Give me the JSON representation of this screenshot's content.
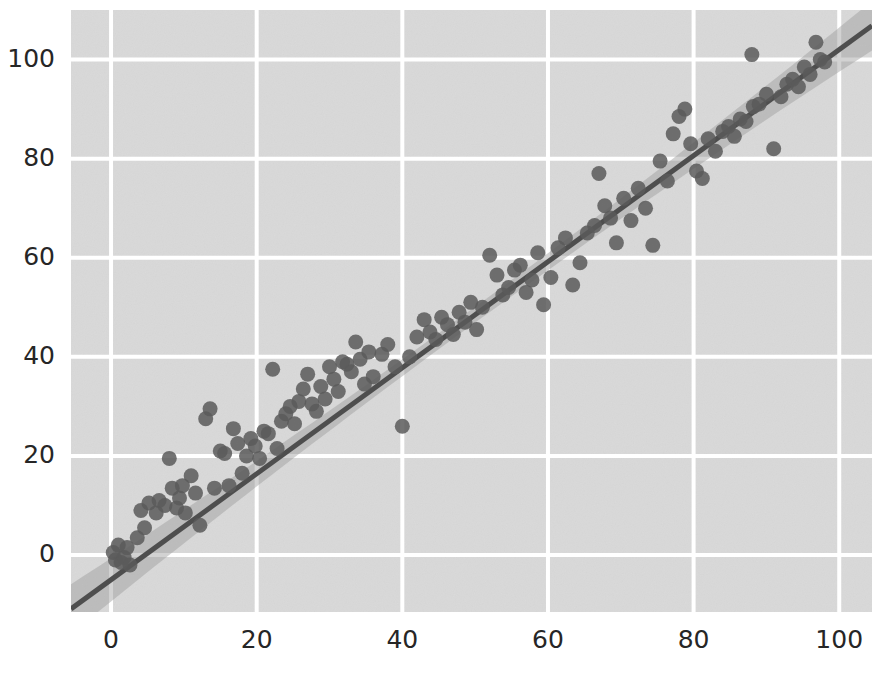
{
  "figure": {
    "width": 872,
    "height": 681,
    "background_color": "#ffffff",
    "style": "seaborn-darkgrid"
  },
  "colors": {
    "axes_background": "#d9d9d9",
    "grid": "#ffffff",
    "marker": "#5a5a5a",
    "regression_line": "#4e4e4e",
    "confidence_band": "#9c9c9c",
    "tick_label": "#262626"
  },
  "chart_data": {
    "type": "scatter",
    "title": "",
    "subtitle": "",
    "xlabel": "",
    "ylabel": "",
    "xlim": [
      -5.5,
      104.5
    ],
    "ylim": [
      -11.5,
      110.0
    ],
    "xticks": [
      0,
      20,
      40,
      60,
      80,
      100
    ],
    "yticks": [
      0,
      20,
      40,
      60,
      80,
      100
    ],
    "xticklabels": [
      "0",
      "20",
      "40",
      "60",
      "80",
      "100"
    ],
    "yticklabels": [
      "0",
      "20",
      "40",
      "60",
      "80",
      "100"
    ],
    "grid": true,
    "grid_axis": "both",
    "legend": null,
    "legend_position": "none",
    "marker": {
      "shape": "circle",
      "size_px": 15,
      "color": "#5a5a5a",
      "alpha": 0.85
    },
    "regression": {
      "shown": true,
      "kind": "linear",
      "slope": 1.07,
      "intercept": -5.0,
      "line_color": "#4e4e4e",
      "line_width_px": 5,
      "confidence_interval": 95,
      "band_color": "#9c9c9c",
      "x_start": -5.5,
      "x_end": 104.5,
      "y_start": -10.9,
      "y_end": 106.8
    },
    "series": [
      {
        "name": "observations",
        "n_points": 116,
        "x": [
          0.3,
          0.6,
          1.0,
          1.4,
          1.8,
          2.2,
          2.6,
          3.6,
          4.1,
          4.6,
          5.2,
          6.2,
          6.6,
          7.4,
          8.0,
          8.4,
          9.0,
          9.4,
          9.8,
          10.2,
          11.0,
          11.6,
          12.2,
          13.0,
          13.6,
          14.2,
          15.0,
          15.6,
          16.2,
          16.8,
          17.4,
          18.0,
          18.6,
          19.2,
          19.8,
          20.4,
          21.0,
          21.6,
          22.2,
          22.8,
          23.4,
          24.0,
          24.6,
          25.2,
          25.8,
          26.4,
          27.0,
          27.6,
          28.2,
          28.8,
          29.4,
          30.0,
          30.6,
          31.2,
          31.8,
          32.4,
          33.0,
          33.6,
          34.2,
          34.8,
          35.4,
          36.0,
          37.2,
          38.0,
          39.0,
          40.0,
          41.0,
          42.0,
          43.0,
          43.8,
          44.6,
          45.4,
          46.2,
          47.0,
          47.8,
          48.6,
          49.4,
          50.2,
          51.0,
          52.0,
          53.0,
          53.8,
          54.6,
          55.4,
          56.2,
          57.0,
          57.8,
          58.6,
          59.4,
          60.4,
          61.4,
          62.4,
          63.4,
          64.4,
          65.4,
          66.4,
          67.0,
          67.8,
          68.6,
          69.4,
          70.4,
          71.4,
          72.4,
          73.4,
          74.4,
          75.4,
          76.4,
          77.2,
          78.0,
          78.8,
          79.6,
          80.4,
          81.2,
          82.0,
          83.0,
          84.0
        ],
        "y": [
          0.5,
          -1.0,
          2.0,
          -1.5,
          -0.5,
          1.5,
          -2.0,
          3.5,
          9.0,
          5.5,
          10.5,
          8.5,
          11.0,
          10.0,
          19.5,
          13.5,
          9.5,
          11.5,
          14.0,
          8.5,
          16.0,
          12.5,
          6.0,
          27.5,
          29.5,
          13.5,
          21.0,
          20.5,
          14.0,
          25.5,
          22.5,
          16.5,
          20.0,
          23.5,
          22.0,
          19.5,
          25.0,
          24.5,
          37.5,
          21.5,
          27.0,
          28.5,
          30.0,
          26.5,
          31.0,
          33.5,
          36.5,
          30.5,
          29.0,
          34.0,
          31.5,
          38.0,
          35.5,
          33.0,
          39.0,
          38.5,
          37.0,
          43.0,
          39.5,
          34.5,
          41.0,
          36.0,
          40.5,
          42.5,
          38.0,
          26.0,
          40.0,
          44.0,
          47.5,
          45.0,
          43.5,
          48.0,
          46.5,
          44.5,
          49.0,
          47.0,
          51.0,
          45.5,
          50.0,
          60.5,
          56.5,
          52.5,
          54.0,
          57.5,
          58.5,
          53.0,
          55.5,
          61.0,
          50.5,
          56.0,
          62.0,
          64.0,
          54.5,
          59.0,
          65.0,
          66.5,
          77.0,
          70.5,
          68.0,
          63.0,
          72.0,
          67.5,
          74.0,
          70.0,
          62.5,
          79.5,
          75.5,
          85.0,
          88.5,
          90.0,
          83.0,
          77.5,
          76.0,
          84.0,
          81.5,
          85.5
        ]
      },
      {
        "name": "observations-upper",
        "n_points": 18,
        "x": [
          84.8,
          85.6,
          86.4,
          87.2,
          88.0,
          88.2,
          89.0,
          90.0,
          91.0,
          92.0,
          92.8,
          93.6,
          94.4,
          95.2,
          96.0,
          96.8,
          97.4,
          98.0
        ],
        "y": [
          86.5,
          84.5,
          88.0,
          87.5,
          101.0,
          90.5,
          91.0,
          93.0,
          82.0,
          92.5,
          95.0,
          96.0,
          94.5,
          98.5,
          97.0,
          103.5,
          100.0,
          99.5
        ]
      }
    ],
    "notable_outliers": [
      {
        "x": 88.0,
        "y": 101.0,
        "note": "high above trend"
      },
      {
        "x": 91.0,
        "y": 82.0,
        "note": "low below trend"
      },
      {
        "x": 40.0,
        "y": 26.0,
        "note": "low below trend"
      },
      {
        "x": 22.2,
        "y": 37.5,
        "note": "high above trend"
      },
      {
        "x": 52.0,
        "y": 60.5,
        "note": "high above trend"
      },
      {
        "x": 67.0,
        "y": 77.0,
        "note": "high above trend"
      }
    ]
  }
}
